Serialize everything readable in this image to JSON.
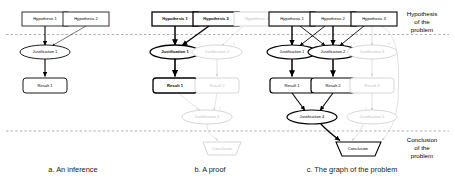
{
  "figure": {
    "band_labels": {
      "top": "Hypothesis\nof the\nproblem",
      "top_lines": [
        "Hypothesis",
        "of the",
        "problem"
      ],
      "bottom": "Conclusion\nof the\nproblem",
      "bottom_lines": [
        "Conclusion",
        "of the",
        "problem"
      ]
    },
    "colors": {
      "stroke_active": "#000000",
      "stroke_faded": "#cccccc",
      "text_active": "#000000",
      "text_faded": "#c2c2c2",
      "dashed_line": "#8c8c8c",
      "background": "#ffffff"
    },
    "panels": [
      {
        "id": "a",
        "caption": "a. An inference",
        "nodes": [
          {
            "id": "a-h1",
            "label": "Hypothesis 1",
            "shape": "rect",
            "state": "active"
          },
          {
            "id": "a-h2",
            "label": "Hypothesis 2",
            "shape": "rect",
            "state": "active"
          },
          {
            "id": "a-j1",
            "label": "Justification 1",
            "shape": "ellipse",
            "state": "active"
          },
          {
            "id": "a-r1",
            "label": "Result 1",
            "shape": "rounded-rect",
            "state": "active"
          }
        ],
        "edges": [
          {
            "from": "a-h1",
            "to": "a-j1",
            "state": "active"
          },
          {
            "from": "a-h2",
            "to": "a-j1",
            "state": "active"
          },
          {
            "from": "a-j1",
            "to": "a-r1",
            "state": "active"
          }
        ]
      },
      {
        "id": "b",
        "caption": "b. A proof",
        "nodes": [
          {
            "id": "b-h1",
            "label": "Hypothesis 1",
            "shape": "rect",
            "state": "active"
          },
          {
            "id": "b-h2",
            "label": "Hypothesis 2",
            "shape": "rect",
            "state": "active"
          },
          {
            "id": "b-h3",
            "label": "Hypothesis 3",
            "shape": "rect",
            "state": "faded"
          },
          {
            "id": "b-j1",
            "label": "Justification 1",
            "shape": "ellipse",
            "state": "active"
          },
          {
            "id": "b-j2",
            "label": "Justification 2",
            "shape": "ellipse",
            "state": "faded"
          },
          {
            "id": "b-r1",
            "label": "Result 1",
            "shape": "rounded-rect",
            "state": "active"
          },
          {
            "id": "b-r2",
            "label": "Result 2",
            "shape": "rounded-rect",
            "state": "faded"
          },
          {
            "id": "b-j4",
            "label": "Justification 4",
            "shape": "ellipse",
            "state": "faded"
          },
          {
            "id": "b-c1",
            "label": "Conclusion",
            "shape": "trapezoid",
            "state": "faded"
          }
        ],
        "edges": [
          {
            "from": "b-h1",
            "to": "b-j1",
            "state": "active"
          },
          {
            "from": "b-h2",
            "to": "b-j1",
            "state": "active"
          },
          {
            "from": "b-h3",
            "to": "b-j2",
            "state": "faded"
          },
          {
            "from": "b-j1",
            "to": "b-r1",
            "state": "active"
          },
          {
            "from": "b-j2",
            "to": "b-r2",
            "state": "faded"
          },
          {
            "from": "b-r1",
            "to": "b-j4",
            "state": "faded"
          },
          {
            "from": "b-r2",
            "to": "b-j4",
            "state": "faded"
          },
          {
            "from": "b-j4",
            "to": "b-c1",
            "state": "faded"
          }
        ]
      },
      {
        "id": "c",
        "caption": "c. The graph of the problem",
        "nodes": [
          {
            "id": "c-h1",
            "label": "Hypothesis 1",
            "shape": "rect",
            "state": "active"
          },
          {
            "id": "c-h2",
            "label": "Hypothesis 2",
            "shape": "rect",
            "state": "active"
          },
          {
            "id": "c-h3",
            "label": "Hypothesis 3",
            "shape": "rect",
            "state": "active"
          },
          {
            "id": "c-j1",
            "label": "Justification 1",
            "shape": "ellipse",
            "state": "active"
          },
          {
            "id": "c-j2",
            "label": "Justification 2",
            "shape": "ellipse",
            "state": "active"
          },
          {
            "id": "c-j3",
            "label": "Justification 3",
            "shape": "ellipse",
            "state": "faded"
          },
          {
            "id": "c-r1",
            "label": "Result 1",
            "shape": "rounded-rect",
            "state": "active"
          },
          {
            "id": "c-r2",
            "label": "Result 2",
            "shape": "rounded-rect",
            "state": "active"
          },
          {
            "id": "c-r3",
            "label": "Result 3",
            "shape": "rounded-rect",
            "state": "faded"
          },
          {
            "id": "c-j4",
            "label": "Justification 4",
            "shape": "ellipse",
            "state": "active"
          },
          {
            "id": "c-j5",
            "label": "Justification 5",
            "shape": "ellipse",
            "state": "faded"
          },
          {
            "id": "c-c1",
            "label": "Conclusion",
            "shape": "trapezoid",
            "state": "active"
          }
        ],
        "edges": [
          {
            "from": "c-h1",
            "to": "c-j1",
            "state": "active"
          },
          {
            "from": "c-h1",
            "to": "c-j2",
            "state": "active"
          },
          {
            "from": "c-h2",
            "to": "c-j1",
            "state": "active"
          },
          {
            "from": "c-h2",
            "to": "c-j2",
            "state": "active"
          },
          {
            "from": "c-h3",
            "to": "c-j2",
            "state": "active"
          },
          {
            "from": "c-h3",
            "to": "c-j3",
            "state": "faded"
          },
          {
            "from": "c-h3",
            "to": "c-j5",
            "state": "faded"
          },
          {
            "from": "c-j1",
            "to": "c-r1",
            "state": "active"
          },
          {
            "from": "c-j2",
            "to": "c-r2",
            "state": "active"
          },
          {
            "from": "c-j3",
            "to": "c-r3",
            "state": "faded"
          },
          {
            "from": "c-r1",
            "to": "c-j4",
            "state": "active"
          },
          {
            "from": "c-r2",
            "to": "c-j4",
            "state": "active"
          },
          {
            "from": "c-r3",
            "to": "c-j5",
            "state": "faded"
          },
          {
            "from": "c-j4",
            "to": "c-c1",
            "state": "active"
          },
          {
            "from": "c-j5",
            "to": "c-c1",
            "state": "faded"
          }
        ]
      }
    ],
    "port_numbers": [
      "1",
      "2",
      "3"
    ]
  }
}
